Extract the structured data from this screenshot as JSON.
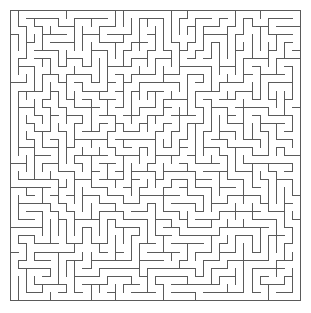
{
  "document": {
    "title": "Maze",
    "type": "maze-puzzle"
  },
  "canvas": {
    "width": 311,
    "height": 313,
    "background_color": "#ffffff"
  },
  "maze": {
    "label": "maze-grid",
    "columns": 36,
    "rows": 36,
    "cell_size": 8.05,
    "origin_x": 10,
    "origin_y": 10,
    "grid_width": 290,
    "grid_height": 290,
    "wall_color": "#5a5a5a",
    "wall_thickness": 1,
    "border_color": "#5a5a5a",
    "border_thickness": 1,
    "passage_color": "#ffffff",
    "algorithm": "recursive-backtracker",
    "seed": 20240517,
    "perfect": true,
    "entrance": "none",
    "exit": "none",
    "solution_shown": false
  },
  "chart_data": {
    "type": "table",
    "categories": [
      "columns",
      "rows",
      "cell_size_px",
      "wall_color"
    ],
    "values": [
      36,
      36,
      8.05,
      "#5a5a5a"
    ]
  }
}
